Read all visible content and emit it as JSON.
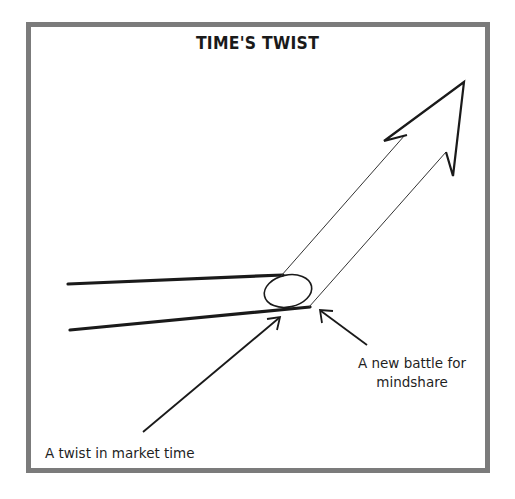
{
  "diagram": {
    "title": "TIME'S TWIST",
    "labels": {
      "twist": "A twist in market time",
      "battle_line1": "A new battle for",
      "battle_line2": "mindshare"
    },
    "colors": {
      "frame": "#7b7b7b",
      "ink": "#1a1a1a",
      "background": "#ffffff"
    },
    "elements": [
      {
        "name": "upper-time-line",
        "type": "line"
      },
      {
        "name": "lower-time-line",
        "type": "line"
      },
      {
        "name": "twist-ellipse",
        "type": "ellipse"
      },
      {
        "name": "rising-arrow",
        "type": "arrow"
      },
      {
        "name": "pointer-arrow-twist",
        "type": "arrow",
        "points_to": "twist-ellipse"
      },
      {
        "name": "pointer-arrow-battle",
        "type": "arrow",
        "points_to": "twist-ellipse"
      }
    ]
  }
}
